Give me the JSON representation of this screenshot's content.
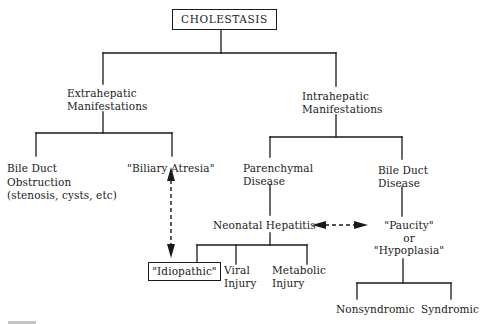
{
  "diagram": {
    "type": "tree",
    "title": "CHOLESTASIS",
    "colors": {
      "line": "#1a1a1a",
      "background": "#ffffff"
    },
    "nodes": {
      "root": {
        "label": "CHOLESTASIS",
        "boxed": true
      },
      "extrahepatic": {
        "lines": [
          "Extrahepatic",
          "Manifestations"
        ]
      },
      "intrahepatic": {
        "lines": [
          "Intrahepatic",
          "Manifestations"
        ]
      },
      "bile_duct_obstruction": {
        "lines": [
          "Bile Duct",
          "Obstruction",
          "(stenosis, cysts, etc)"
        ]
      },
      "biliary_atresia": {
        "label": "\"Biliary Atresia\""
      },
      "parenchymal_disease": {
        "lines": [
          "Parenchymal",
          "Disease"
        ]
      },
      "bile_duct_disease": {
        "lines": [
          "Bile Duct",
          "Disease"
        ]
      },
      "neonatal_hepatitis": {
        "label": "Neonatal Hepatitis"
      },
      "paucity": {
        "lines": [
          "\"Paucity\"",
          "or",
          "\"Hypoplasia\""
        ]
      },
      "idiopathic": {
        "label": "\"Idiopathic\"",
        "boxed": true
      },
      "viral_injury": {
        "lines": [
          "Viral",
          "Injury"
        ]
      },
      "metabolic_injury": {
        "lines": [
          "Metabolic",
          "Injury"
        ]
      },
      "nonsyndromic": {
        "label": "Nonsyndromic"
      },
      "syndromic": {
        "label": "Syndromic"
      }
    },
    "edges": [
      {
        "from": "root",
        "to": "extrahepatic",
        "style": "solid"
      },
      {
        "from": "root",
        "to": "intrahepatic",
        "style": "solid"
      },
      {
        "from": "extrahepatic",
        "to": "bile_duct_obstruction",
        "style": "solid"
      },
      {
        "from": "extrahepatic",
        "to": "biliary_atresia",
        "style": "solid"
      },
      {
        "from": "intrahepatic",
        "to": "parenchymal_disease",
        "style": "solid"
      },
      {
        "from": "intrahepatic",
        "to": "bile_duct_disease",
        "style": "solid"
      },
      {
        "from": "parenchymal_disease",
        "to": "neonatal_hepatitis",
        "style": "solid"
      },
      {
        "from": "bile_duct_disease",
        "to": "paucity",
        "style": "solid"
      },
      {
        "from": "neonatal_hepatitis",
        "to": "idiopathic",
        "style": "solid"
      },
      {
        "from": "neonatal_hepatitis",
        "to": "viral_injury",
        "style": "solid"
      },
      {
        "from": "neonatal_hepatitis",
        "to": "metabolic_injury",
        "style": "solid"
      },
      {
        "from": "paucity",
        "to": "nonsyndromic",
        "style": "solid"
      },
      {
        "from": "paucity",
        "to": "syndromic",
        "style": "solid"
      },
      {
        "from": "biliary_atresia",
        "to": "idiopathic",
        "style": "dashed-bidirectional-arrow"
      },
      {
        "from": "neonatal_hepatitis",
        "to": "paucity",
        "style": "dashed-bidirectional-arrow"
      }
    ]
  }
}
